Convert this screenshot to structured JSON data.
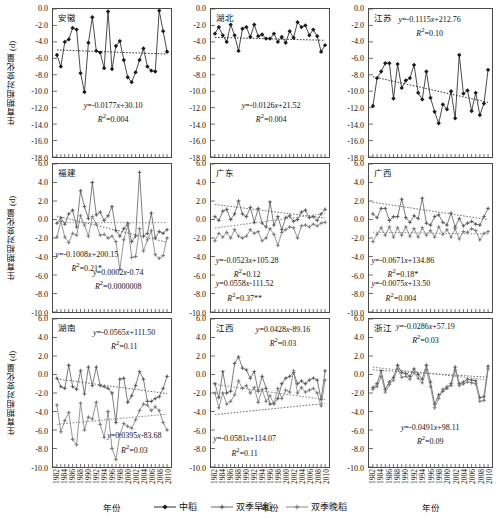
{
  "axes": {
    "y_label": "生育期相对变化量 (d)",
    "x_label": "年份",
    "y_ticks_row1": [
      "0.0",
      "-2.0",
      "-4.0",
      "-6.0",
      "-8.0",
      "-10.0",
      "-12.0",
      "-14.0",
      "-16.0",
      "-18.0"
    ],
    "y_ticks_row23": [
      "6.0",
      "4.0",
      "2.0",
      "0.0",
      "-2.0",
      "-4.0",
      "-6.0",
      "-8.0",
      "-10.0"
    ],
    "x_ticks": [
      "1982",
      "1984",
      "1986",
      "1988",
      "1990",
      "1992",
      "1994",
      "1996",
      "1998",
      "2000",
      "2002",
      "2004",
      "2006",
      "2008",
      "2010"
    ]
  },
  "legend": {
    "items": [
      {
        "label": "中稻",
        "marker": "diamond",
        "color": "#1a1a1a"
      },
      {
        "label": "双季早稻",
        "marker": "star",
        "color": "#5a5a5a"
      },
      {
        "label": "双季晚稻",
        "marker": "star",
        "color": "#7a7a7a"
      }
    ]
  },
  "chart_data": {
    "type": "line",
    "xlabel": "年份",
    "ylabel": "生育期相对变化量 (d)",
    "x": [
      1982,
      1983,
      1984,
      1985,
      1986,
      1987,
      1988,
      1989,
      1990,
      1991,
      1992,
      1993,
      1994,
      1995,
      1996,
      1997,
      1998,
      1999,
      2000,
      2001,
      2002,
      2003,
      2004,
      2005,
      2006,
      2007,
      2008,
      2009,
      2010
    ],
    "grid": false,
    "legend_position": "bottom-center",
    "panels": [
      {
        "name": "安徽",
        "row": 1,
        "ylim": [
          -18.0,
          0.0
        ],
        "equations": [
          {
            "text": "y=-0.0177x+30.10",
            "r2": "R²=0.004",
            "series": "中稻"
          }
        ],
        "series": [
          {
            "name": "中稻",
            "color": "#1a1a1a",
            "marker": "diamond",
            "trend": {
              "slope": -0.0177,
              "intercept": 30.1,
              "r2": 0.004
            },
            "values": [
              -5.6,
              -7.0,
              -4.0,
              -3.7,
              -2.3,
              -2.5,
              -7.8,
              -10.1,
              -4.1,
              -1.0,
              -5.1,
              -5.3,
              -7.2,
              -0.3,
              -7.3,
              -4.5,
              -3.9,
              -6.2,
              -8.3,
              -8.9,
              -7.7,
              -6.2,
              -4.8,
              -7.0,
              -7.5,
              -7.6,
              -0.2,
              -2.7,
              -5.2
            ]
          }
        ]
      },
      {
        "name": "湖北",
        "row": 1,
        "ylim": [
          -18.0,
          0.0
        ],
        "equations": [
          {
            "text": "y=-0.0126x+21.52",
            "r2": "R²=0.004",
            "series": "中稻"
          }
        ],
        "series": [
          {
            "name": "中稻",
            "color": "#1a1a1a",
            "marker": "diamond",
            "trend": {
              "slope": -0.0126,
              "intercept": 21.52,
              "r2": 0.004
            },
            "values": [
              -3.0,
              -2.2,
              -3.2,
              -4.0,
              -1.9,
              -3.2,
              -5.1,
              -2.4,
              -2.2,
              -3.4,
              -1.9,
              -3.3,
              -3.1,
              -3.6,
              -3.6,
              -3.0,
              -4.0,
              -3.4,
              -4.1,
              -2.7,
              -3.5,
              -1.6,
              -2.2,
              -2.0,
              -3.2,
              -2.5,
              -3.3,
              -5.2,
              -4.4
            ]
          }
        ]
      },
      {
        "name": "江苏",
        "row": 1,
        "ylim": [
          -18.0,
          0.0
        ],
        "equations": [
          {
            "text": "y=-0.1115x+212.76",
            "r2": "R²=0.10",
            "series": "中稻"
          }
        ],
        "series": [
          {
            "name": "中稻",
            "color": "#1a1a1a",
            "marker": "diamond",
            "trend": {
              "slope": -0.1115,
              "intercept": 212.76,
              "r2": 0.1
            },
            "values": [
              -11.8,
              -8.4,
              -7.6,
              -6.6,
              -6.6,
              -10.9,
              -6.7,
              -9.6,
              -8.7,
              -8.4,
              -6.8,
              -10.2,
              -11.0,
              -7.6,
              -10.8,
              -12.5,
              -13.9,
              -11.6,
              -12.2,
              -10.0,
              -13.3,
              -5.6,
              -10.3,
              -9.9,
              -12.4,
              -10.2,
              -12.9,
              -11.5,
              -7.4
            ]
          }
        ]
      },
      {
        "name": "福建",
        "row": 2,
        "ylim": [
          -10.0,
          6.0
        ],
        "equations": [
          {
            "text": "y=-0.1008x+200.15",
            "r2": "R²=0.21*",
            "series": "双季早稻"
          },
          {
            "text": "y=0.0002x-0.74",
            "r2": "R²=0.0000008",
            "series": "双季晚稻"
          }
        ],
        "series": [
          {
            "name": "双季早稻",
            "color": "#5a5a5a",
            "marker": "star",
            "trend": {
              "slope": -0.1008,
              "intercept": 200.15,
              "r2": 0.21
            },
            "values": [
              -0.4,
              0.2,
              -0.5,
              0.6,
              1.0,
              -0.8,
              3.1,
              1.4,
              0.1,
              4.0,
              0.5,
              0.8,
              -0.1,
              0.4,
              1.4,
              -1.2,
              -1.8,
              -1.0,
              -0.4,
              -2.4,
              -1.8,
              5.1,
              -1.8,
              -1.5,
              0.7,
              -2.0,
              -1.3,
              -1.5,
              -1.1
            ]
          },
          {
            "name": "双季晚稻",
            "color": "#7a7a7a",
            "marker": "star",
            "trend": {
              "slope": 0.0002,
              "intercept": -0.74,
              "r2": 8e-07
            },
            "values": [
              -1.9,
              -0.2,
              -1.9,
              -2.5,
              -1.5,
              -1.7,
              0.4,
              -0.6,
              -1.8,
              0.3,
              -0.5,
              -1.7,
              -1.6,
              -2.0,
              -1.8,
              -2.4,
              -5.4,
              -2.2,
              -0.6,
              -4.1,
              -4.0,
              -1.0,
              -3.4,
              -2.2,
              -1.2,
              -3.8,
              -4.2,
              -3.9,
              -2.0
            ]
          }
        ]
      },
      {
        "name": "广东",
        "row": 2,
        "ylim": [
          -10.0,
          6.0
        ],
        "equations": [
          {
            "text": "y=-0.0523x+105.28",
            "r2": "R²=0.12",
            "series": "双季早稻"
          },
          {
            "text": "y=0.0558x-111.52",
            "r2": "R²=0.37**",
            "series": "双季晚稻"
          }
        ],
        "series": [
          {
            "name": "双季早稻",
            "color": "#5a5a5a",
            "marker": "star",
            "trend": {
              "slope": -0.0523,
              "intercept": 105.28,
              "r2": 0.12
            },
            "values": [
              0.3,
              -0.1,
              0.9,
              1.1,
              0.0,
              0.6,
              2.0,
              0.6,
              0.3,
              1.3,
              -0.3,
              1.2,
              -0.4,
              -0.8,
              1.9,
              -0.6,
              0.3,
              -1.1,
              0.2,
              0.4,
              -0.2,
              0.0,
              0.8,
              1.0,
              0.2,
              0.3,
              -0.1,
              0.6,
              1.1
            ]
          },
          {
            "name": "双季晚稻",
            "color": "#7a7a7a",
            "marker": "star",
            "trend": {
              "slope": 0.0558,
              "intercept": -111.52,
              "r2": 0.37
            },
            "values": [
              -2.3,
              -1.5,
              -1.9,
              -1.4,
              -2.0,
              -1.1,
              -1.8,
              -2.0,
              -1.8,
              -1.1,
              -1.5,
              -1.3,
              -2.3,
              -2.0,
              -1.0,
              -1.6,
              -2.8,
              -1.4,
              -1.1,
              -0.8,
              -0.9,
              -2.0,
              -0.7,
              -0.6,
              -0.8,
              -0.5,
              -0.7,
              -0.4,
              -0.3
            ]
          }
        ]
      },
      {
        "name": "广西",
        "row": 2,
        "ylim": [
          -10.0,
          6.0
        ],
        "equations": [
          {
            "text": "y=-0.0671x+134.86",
            "r2": "R²=0.18*",
            "series": "双季早稻"
          },
          {
            "text": "y=-0.0075x+13.50",
            "r2": "R²=0.004",
            "series": "双季晚稻"
          }
        ],
        "series": [
          {
            "name": "双季早稻",
            "color": "#5a5a5a",
            "marker": "star",
            "trend": {
              "slope": -0.0671,
              "intercept": 134.86,
              "r2": 0.18
            },
            "values": [
              0.6,
              0.2,
              1.2,
              1.2,
              -0.1,
              0.3,
              0.3,
              2.2,
              0.2,
              -0.3,
              0.4,
              0.1,
              2.3,
              -0.4,
              -0.6,
              0.3,
              0.5,
              -0.3,
              -0.6,
              0.7,
              -0.8,
              0.1,
              -0.7,
              -0.4,
              -0.2,
              -0.5,
              -0.6,
              0.3,
              1.2
            ]
          },
          {
            "name": "双季晚稻",
            "color": "#7a7a7a",
            "marker": "star",
            "trend": {
              "slope": -0.0075,
              "intercept": 13.5,
              "r2": 0.004
            },
            "values": [
              -2.4,
              -1.6,
              -0.9,
              -1.7,
              -0.8,
              -1.9,
              -0.9,
              -1.7,
              -0.8,
              -1.8,
              -1.0,
              -1.9,
              -0.9,
              -1.7,
              -1.2,
              -1.9,
              -0.8,
              -1.6,
              -1.1,
              -1.9,
              -1.0,
              -2.1,
              -1.3,
              -1.4,
              -1.0,
              -1.2,
              -2.2,
              -1.5,
              -1.3
            ]
          }
        ]
      },
      {
        "name": "湖南",
        "row": 3,
        "ylim": [
          -10.0,
          6.0
        ],
        "equations": [
          {
            "text": "y=-0.0565x+111.50",
            "r2": "R²=0.11",
            "series": "双季早稻"
          },
          {
            "text": "y=0.0395x-83.68",
            "r2": "R²=0.03",
            "series": "双季晚稻"
          }
        ],
        "series": [
          {
            "name": "双季早稻",
            "color": "#5a5a5a",
            "marker": "star",
            "trend": {
              "slope": -0.0565,
              "intercept": 111.5,
              "r2": 0.11
            },
            "values": [
              -0.4,
              -1.3,
              -1.5,
              1.0,
              -1.3,
              -1.6,
              0.4,
              -2.1,
              0.8,
              -1.2,
              0.8,
              -1.2,
              -1.3,
              -1.5,
              -2.0,
              -5.2,
              -0.5,
              -0.4,
              -3.0,
              -2.3,
              -1.2,
              0.3,
              -0.5,
              -2.9,
              -2.9,
              -2.6,
              -2.4,
              -1.5,
              -0.2
            ]
          },
          {
            "name": "双季晚稻",
            "color": "#7a7a7a",
            "marker": "star",
            "trend": {
              "slope": 0.0395,
              "intercept": -83.68,
              "r2": 0.03
            },
            "values": [
              -3.3,
              -6.2,
              -5.0,
              -4.1,
              -7.0,
              -7.6,
              -3.1,
              -6.0,
              -4.6,
              -4.8,
              -3.0,
              -5.4,
              -6.8,
              -4.0,
              -8.0,
              -9.2,
              -6.5,
              -5.3,
              -5.6,
              -5.8,
              -4.9,
              -3.9,
              -3.2,
              -3.3,
              -3.9,
              -3.5,
              -3.9,
              -5.2,
              -6.0
            ]
          }
        ]
      },
      {
        "name": "江西",
        "row": 3,
        "ylim": [
          -10.0,
          6.0
        ],
        "equations": [
          {
            "text": "y=0.0428x-89.16",
            "r2": "R²=0.03",
            "series": "双季早稻"
          },
          {
            "text": "y=-0.0581x+114.07",
            "r2": "R²=0.11",
            "series": "双季晚稻"
          }
        ],
        "series": [
          {
            "name": "双季早稻",
            "color": "#5a5a5a",
            "marker": "star",
            "trend": {
              "slope": 0.0428,
              "intercept": -89.16,
              "r2": 0.03
            },
            "values": [
              -1.0,
              -2.5,
              0.3,
              -2.0,
              -1.8,
              1.2,
              1.9,
              0.7,
              0.5,
              -0.4,
              0.3,
              -1.8,
              -0.2,
              -1.5,
              -3.2,
              -3.1,
              -2.6,
              -1.0,
              -0.4,
              -0.2,
              0.2,
              -1.0,
              -0.7,
              -1.0,
              -0.6,
              -0.4,
              -0.6,
              -2.7,
              0.4
            ]
          },
          {
            "name": "双季晚稻",
            "color": "#7a7a7a",
            "marker": "star",
            "trend": {
              "slope": -0.0581,
              "intercept": 114.07,
              "r2": 0.11
            },
            "values": [
              -2.0,
              -3.6,
              -2.0,
              -3.2,
              -2.9,
              -2.2,
              -0.7,
              -1.5,
              -1.2,
              -2.0,
              -1.4,
              -3.0,
              -1.6,
              -2.9,
              -2.3,
              -3.2,
              -1.5,
              -2.6,
              -1.7,
              -1.9,
              0.4,
              -2.0,
              -1.4,
              -1.9,
              -1.7,
              -1.5,
              -2.0,
              -3.4,
              -0.6
            ]
          }
        ]
      },
      {
        "name": "浙江",
        "row": 3,
        "ylim": [
          -10.0,
          6.0
        ],
        "equations": [
          {
            "text": "y=-0.0286x+57.19",
            "r2": "R²=0.03",
            "series": "双季早稻"
          },
          {
            "text": "y=-0.0491x+98.11",
            "r2": "R²=0.09",
            "series": "双季晚稻"
          }
        ],
        "series": [
          {
            "name": "双季早稻",
            "color": "#5a5a5a",
            "marker": "star",
            "trend": {
              "slope": -0.0286,
              "intercept": 57.19,
              "r2": 0.03
            },
            "values": [
              -1.4,
              -1.0,
              0.4,
              -1.6,
              -0.8,
              -0.3,
              1.0,
              0.2,
              0.1,
              -0.2,
              0.6,
              0.0,
              -0.5,
              1.0,
              -0.8,
              -3.2,
              -2.2,
              -1.8,
              -1.5,
              -1.0,
              0.8,
              -1.0,
              -0.8,
              -0.5,
              -0.6,
              -0.7,
              -2.5,
              -2.4,
              0.9
            ]
          },
          {
            "name": "双季晚稻",
            "color": "#7a7a7a",
            "marker": "star",
            "trend": {
              "slope": -0.0491,
              "intercept": 98.11,
              "r2": 0.09
            },
            "values": [
              -1.6,
              -1.3,
              -0.2,
              -1.9,
              -1.1,
              -0.6,
              0.6,
              -0.3,
              -0.2,
              -0.5,
              0.2,
              -0.4,
              -0.9,
              0.5,
              -1.3,
              -3.6,
              -2.6,
              -1.6,
              -1.3,
              -1.2,
              0.5,
              -1.2,
              -1.0,
              -0.8,
              -0.9,
              -1.0,
              -2.9,
              -2.8,
              0.6
            ]
          }
        ]
      }
    ]
  }
}
